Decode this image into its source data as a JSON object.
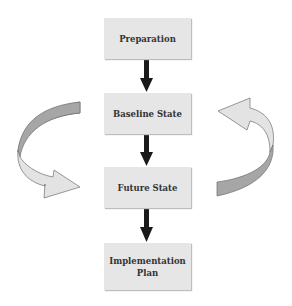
{
  "diagram": {
    "type": "process-flow",
    "steps": [
      {
        "label": "Preparation"
      },
      {
        "label": "Baseline State"
      },
      {
        "label": "Future State"
      },
      {
        "label": "Implementation\nPlan"
      }
    ],
    "connectors": [
      {
        "from": "Preparation",
        "to": "Baseline State",
        "kind": "straight-arrow"
      },
      {
        "from": "Baseline State",
        "to": "Future State",
        "kind": "straight-arrow"
      },
      {
        "from": "Future State",
        "to": "Implementation Plan",
        "kind": "straight-arrow"
      }
    ],
    "cycle_arrows": [
      {
        "side": "left",
        "direction": "from Baseline State down to Future State",
        "kind": "curved-ribbon-arrow"
      },
      {
        "side": "right",
        "direction": "from Future State up to Baseline State",
        "kind": "curved-ribbon-arrow"
      }
    ],
    "colors": {
      "box_fill": "#e6e6e6",
      "arrow": "#1a1a1a",
      "ribbon_dark": "#a6a6a6",
      "ribbon_light": "#e3e3e3",
      "outline": "#6e6e6e"
    }
  }
}
